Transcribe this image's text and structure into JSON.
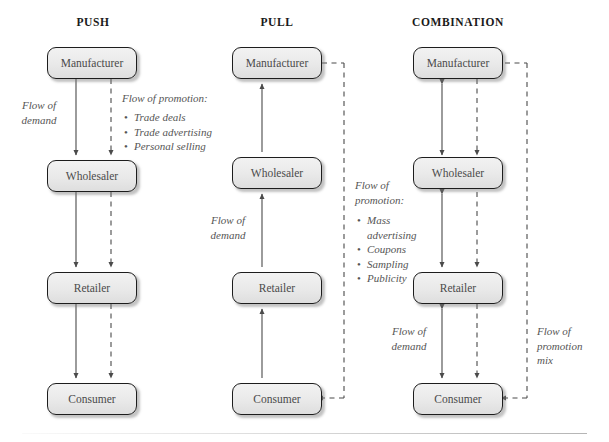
{
  "diagram": {
    "columns": [
      {
        "id": "push",
        "title": "PUSH",
        "nodes": [
          {
            "id": "manufacturer",
            "label": "Manufacturer"
          },
          {
            "id": "wholesaler",
            "label": "Wholesaler"
          },
          {
            "id": "retailer",
            "label": "Retailer"
          },
          {
            "id": "consumer",
            "label": "Consumer"
          }
        ],
        "labels": {
          "demand": "Flow of\ndemand",
          "promotion_heading": "Flow of promotion:",
          "promotion_items": [
            "Trade deals",
            "Trade advertising",
            "Personal selling"
          ]
        }
      },
      {
        "id": "pull",
        "title": "PULL",
        "nodes": [
          {
            "id": "manufacturer",
            "label": "Manufacturer"
          },
          {
            "id": "wholesaler",
            "label": "Wholesaler"
          },
          {
            "id": "retailer",
            "label": "Retailer"
          },
          {
            "id": "consumer",
            "label": "Consumer"
          }
        ],
        "labels": {
          "demand": "Flow of\ndemand",
          "promotion_heading": "Flow of\npromotion:",
          "promotion_items": [
            "Mass advertising",
            "Coupons",
            "Sampling",
            "Publicity"
          ]
        }
      },
      {
        "id": "combination",
        "title": "COMBINATION",
        "nodes": [
          {
            "id": "manufacturer",
            "label": "Manufacturer"
          },
          {
            "id": "wholesaler",
            "label": "Wholesaler"
          },
          {
            "id": "retailer",
            "label": "Retailer"
          },
          {
            "id": "consumer",
            "label": "Consumer"
          }
        ],
        "labels": {
          "demand": "Flow of\ndemand",
          "promotion_mix": "Flow of\npromotion\nmix"
        }
      }
    ],
    "colors": {
      "node_fill": "#ebebeb",
      "node_stroke": "#1d1d1d",
      "arrow": "#555555",
      "text": "#555555",
      "title": "#1a1a1a"
    }
  }
}
